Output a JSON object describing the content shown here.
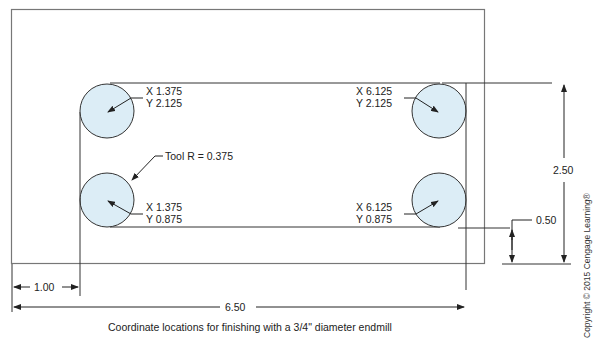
{
  "drawing": {
    "caption": "Coordinate locations for finishing with a 3/4\" diameter endmill",
    "copyright": "Copyright © 2015 Cengage Learning®",
    "tool_label": "Tool R = 0.375",
    "points": [
      {
        "x_label": "X 1.375",
        "y_label": "Y 2.125"
      },
      {
        "x_label": "X 6.125",
        "y_label": "Y 2.125"
      },
      {
        "x_label": "X 1.375",
        "y_label": "Y 0.875"
      },
      {
        "x_label": "X 6.125",
        "y_label": "Y 0.875"
      }
    ],
    "dimensions": {
      "left_offset": "1.00",
      "total_width": "6.50",
      "height": "2.50",
      "bottom_offset": "0.50"
    },
    "colors": {
      "circle_fill": "#dcedf6",
      "line": "#333333",
      "border": "#777777"
    }
  }
}
